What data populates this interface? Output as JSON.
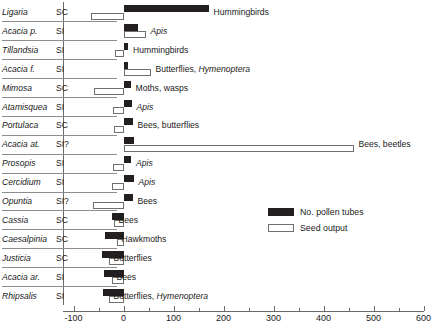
{
  "chart_data": {
    "type": "bar",
    "title": "",
    "xlabel": "",
    "ylabel": "",
    "xlim": [
      -100,
      600
    ],
    "xticks": [
      -100,
      0,
      100,
      200,
      300,
      400,
      500,
      600
    ],
    "xtick_labels": [
      "-100",
      "0",
      "100",
      "200",
      "300",
      "400",
      "500",
      "600"
    ],
    "xminor_step": 50,
    "grid": false,
    "orientation": "horizontal",
    "zero_line": 0,
    "legend": {
      "position": "right-middle",
      "entries": [
        {
          "label": "No. pollen tubes",
          "style": "filled",
          "color": "#231f20"
        },
        {
          "label": "Seed output",
          "style": "outline",
          "color": "#ffffff"
        }
      ]
    },
    "columns": [
      "Taxon",
      "Breeding system",
      "Pollinators",
      "No. pollen tubes",
      "Seed output"
    ],
    "categories": [
      "Ligaria",
      "Acacia p.",
      "Tillandsia",
      "Acacia f.",
      "Mimosa",
      "Atamisquea",
      "Portulaca",
      "Acacia at.",
      "Prosopis",
      "Cercidium",
      "Opuntia",
      "Cassia",
      "Caesalpinia",
      "Justicia",
      "Acacia ar.",
      "Rhipsalis"
    ],
    "series": [
      {
        "name": "No. pollen tubes",
        "values": [
          170,
          28,
          9,
          8,
          14,
          16,
          18,
          20,
          15,
          20,
          18,
          -24,
          -38,
          -44,
          -40,
          -42
        ]
      },
      {
        "name": "Seed output",
        "values": [
          -66,
          44,
          -18,
          54,
          -60,
          -22,
          -20,
          460,
          -22,
          -24,
          -62,
          -20,
          -14,
          -30,
          -24,
          -30
        ]
      }
    ],
    "rows": [
      {
        "taxon": "Ligaria",
        "breeding": "SC",
        "pollinators": "Hummingbirds",
        "pollen_tubes": 170,
        "seed_output": -66
      },
      {
        "taxon": "Acacia p.",
        "breeding": "SI",
        "pollinators": "Apis",
        "pollen_tubes": 28,
        "seed_output": 44
      },
      {
        "taxon": "Tillandsia",
        "breeding": "SI",
        "pollinators": "Hummingbirds",
        "pollen_tubes": 9,
        "seed_output": -18
      },
      {
        "taxon": "Acacia f.",
        "breeding": "SI",
        "pollinators": "Butterflies, Hymenoptera",
        "pollen_tubes": 8,
        "seed_output": 54
      },
      {
        "taxon": "Mimosa",
        "breeding": "SC",
        "pollinators": "Moths, wasps",
        "pollen_tubes": 14,
        "seed_output": -60
      },
      {
        "taxon": "Atamisquea",
        "breeding": "SI",
        "pollinators": "Apis",
        "pollen_tubes": 16,
        "seed_output": -22
      },
      {
        "taxon": "Portulaca",
        "breeding": "SC",
        "pollinators": "Bees, butterflies",
        "pollen_tubes": 18,
        "seed_output": -20
      },
      {
        "taxon": "Acacia at.",
        "breeding": "SI?",
        "pollinators": "Bees, beetles",
        "pollen_tubes": 20,
        "seed_output": 460
      },
      {
        "taxon": "Prosopis",
        "breeding": "SI",
        "pollinators": "Apis",
        "pollen_tubes": 15,
        "seed_output": -22
      },
      {
        "taxon": "Cercidium",
        "breeding": "SI",
        "pollinators": "Apis",
        "pollen_tubes": 20,
        "seed_output": -24
      },
      {
        "taxon": "Opuntia",
        "breeding": "SI?",
        "pollinators": "Bees",
        "pollen_tubes": 18,
        "seed_output": -62
      },
      {
        "taxon": "Cassia",
        "breeding": "SC",
        "pollinators": "Bees",
        "pollen_tubes": -24,
        "seed_output": -20
      },
      {
        "taxon": "Caesalpinia",
        "breeding": "SC",
        "pollinators": "Hawkmoths",
        "pollen_tubes": -38,
        "seed_output": -14
      },
      {
        "taxon": "Justicia",
        "breeding": "SC",
        "pollinators": "Butterflies",
        "pollen_tubes": -44,
        "seed_output": -30
      },
      {
        "taxon": "Acacia ar.",
        "breeding": "SI",
        "pollinators": "Bees",
        "pollen_tubes": -40,
        "seed_output": -24
      },
      {
        "taxon": "Rhipsalis",
        "breeding": "SI",
        "pollinators": "Butterflies, Hymenoptera",
        "pollen_tubes": -42,
        "seed_output": -30
      }
    ]
  }
}
